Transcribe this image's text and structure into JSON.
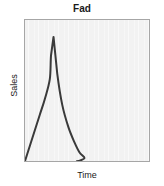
{
  "chart_data": {
    "type": "line",
    "title": "Fad",
    "subtitle": "",
    "xlabel": "Time",
    "ylabel": "Sales",
    "grid": false,
    "legend": null,
    "axis_ticks": {
      "x": [],
      "y": []
    },
    "xlim": [
      0,
      100
    ],
    "ylim": [
      0,
      100
    ],
    "annotations": [],
    "series": [
      {
        "name": "Fad product life cycle",
        "comment": "Sales rise very steeply to a sharp peak, then decay rapidly back to zero.",
        "x": [
          0,
          4,
          8,
          12,
          16,
          20,
          21,
          23,
          26,
          30,
          35,
          40,
          44,
          48,
          43,
          42
        ],
        "y": [
          0,
          11,
          22,
          33,
          44,
          58,
          75,
          88,
          62,
          40,
          24,
          13,
          6,
          2,
          0,
          0
        ]
      }
    ],
    "peak": {
      "x": 23,
      "y": 88
    },
    "style": {
      "line_color": "#3a3a3a",
      "line_width": 2,
      "plot_background": "#f2f2f2",
      "frame_color": "#a6a6a6",
      "page_background": "#ffffff",
      "text_color": "#1a1a1a"
    }
  },
  "figure": {
    "title": "Fad",
    "ylabel": "Sales",
    "xlabel": "Time"
  }
}
